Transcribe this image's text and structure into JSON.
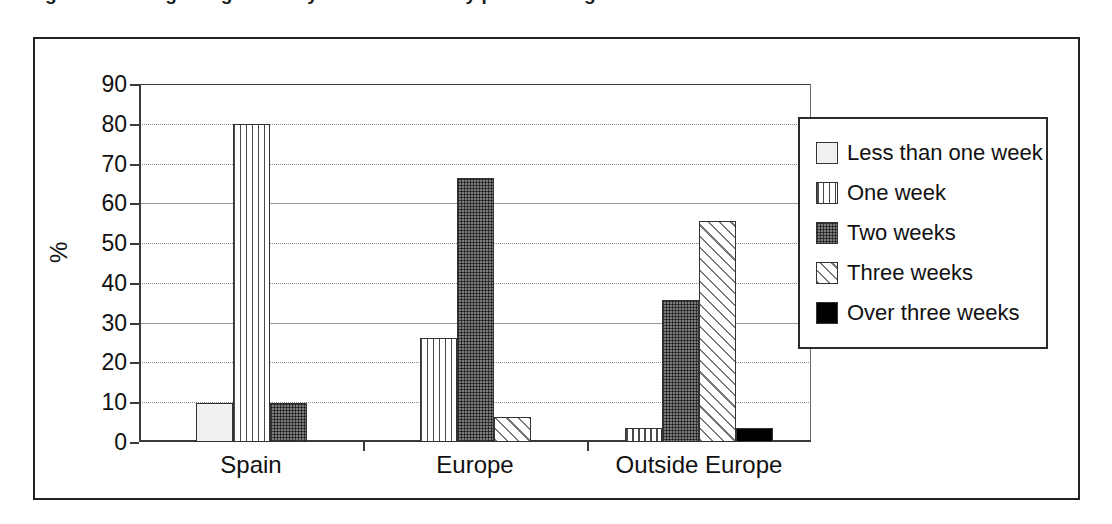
{
  "caption": {
    "text": "Figure 8. Average length of stay in destination by place of origin of visitors"
  },
  "chart_data": {
    "type": "bar",
    "title": "",
    "subtitle": "",
    "xlabel": "",
    "ylabel": "%",
    "ylim": [
      0,
      90
    ],
    "ytick_step": 10,
    "yticks": [
      "90",
      "80",
      "70",
      "60",
      "50",
      "40",
      "30",
      "20",
      "10",
      "0"
    ],
    "grid": true,
    "grid_axis": "y",
    "legend_position": "right",
    "categories": [
      "Spain",
      "Europe",
      "Outside Europe"
    ],
    "series": [
      {
        "name": "Less than one week",
        "pattern": "plain-light",
        "values": [
          9.8,
          0,
          0
        ]
      },
      {
        "name": "One week",
        "pattern": "vertical-stripes",
        "values": [
          80.0,
          26.2,
          3.5
        ]
      },
      {
        "name": "Two weeks",
        "pattern": "dark-stipple",
        "values": [
          9.8,
          66.3,
          35.8
        ]
      },
      {
        "name": "Three weeks",
        "pattern": "diagonal-hatch",
        "values": [
          0,
          6.4,
          55.5
        ]
      },
      {
        "name": "Over three weeks",
        "pattern": "solid-black",
        "values": [
          0,
          0,
          3.5
        ]
      }
    ],
    "colors": {
      "plain-light": "#f0f0f0",
      "vertical-stripes": "#ffffff",
      "dark-stipple": "#7d7d7d",
      "diagonal-hatch": "#ffffff",
      "solid-black": "#000000",
      "outline": "#333333",
      "gridline": "#8a8a8a",
      "axis": "#3a3a3a",
      "text": "#111111"
    }
  }
}
